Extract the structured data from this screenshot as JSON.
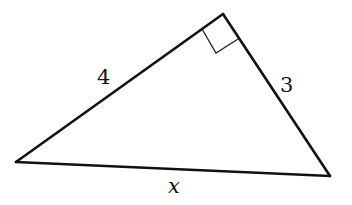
{
  "figure": {
    "type": "right-triangle",
    "right_angle_at": "top vertex",
    "sides": [
      {
        "id": "left-leg",
        "label": "4"
      },
      {
        "id": "right-leg",
        "label": "3"
      },
      {
        "id": "hypotenuse",
        "label": "x"
      }
    ]
  },
  "labels": {
    "left_leg": "4",
    "right_leg": "3",
    "hypotenuse": "x"
  },
  "colors": {
    "stroke": "#111111",
    "background": "#ffffff"
  }
}
